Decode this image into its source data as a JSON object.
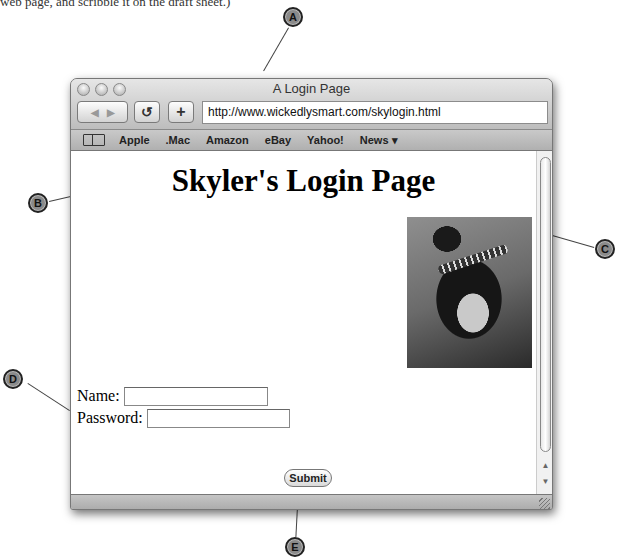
{
  "intro_text": "web page, and scribble it on the draft sheet.)",
  "callouts": {
    "a": "A",
    "b": "B",
    "c": "C",
    "d": "D",
    "e": "E"
  },
  "window": {
    "title": "A Login Page",
    "toolbar": {
      "back_icon": "back-arrow",
      "forward_icon": "forward-arrow",
      "reload_glyph": "↺",
      "add_bookmark_glyph": "+",
      "url": "http://www.wickedlysmart.com/skylogin.html"
    },
    "bookmarks": [
      {
        "label": "Apple"
      },
      {
        "label": ".Mac"
      },
      {
        "label": "Amazon"
      },
      {
        "label": "eBay"
      },
      {
        "label": "Yahoo!"
      },
      {
        "label": "News ▾"
      }
    ]
  },
  "page": {
    "heading": "Skyler's Login Page",
    "photo_alt": "photo of Skyler",
    "form": {
      "name_label": "Name:",
      "name_value": "",
      "password_label": "Password:",
      "password_value": "",
      "submit_label": "Submit"
    }
  },
  "scrollbar": {
    "up_glyph": "▲",
    "down_glyph": "▼"
  }
}
